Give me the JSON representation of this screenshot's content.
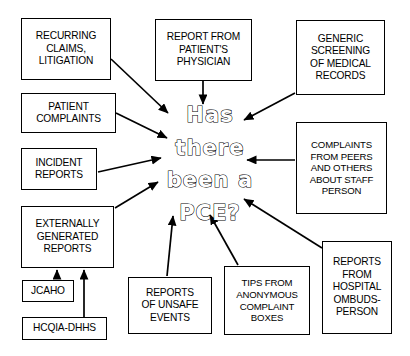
{
  "diagram": {
    "title": "Has there been a PCE?",
    "type": "convergent-flow-diagram",
    "background_color": "#ffffff",
    "line_color": "#000000",
    "center": {
      "lines": [
        "Has",
        "there",
        "been a",
        "PCE?"
      ],
      "full_text": "Has there been a PCE?",
      "style": "outlined"
    },
    "nodes": [
      {
        "id": "recurring-claims-litigation",
        "label": "RECURRING\nCLAIMS,\nLITIGATION",
        "x": 21,
        "y": 18,
        "w": 90,
        "h": 62
      },
      {
        "id": "report-from-patients-physician",
        "label": "REPORT FROM\nPATIENT'S\nPHYSICIAN",
        "x": 155,
        "y": 19,
        "w": 97,
        "h": 62
      },
      {
        "id": "generic-screening-of-medical-records",
        "label": "GENERIC\nSCREENING\nOF MEDICAL\nRECORDS",
        "x": 296,
        "y": 20,
        "w": 89,
        "h": 75
      },
      {
        "id": "patient-complaints",
        "label": "PATIENT\nCOMPLAINTS",
        "x": 21,
        "y": 93,
        "w": 95,
        "h": 40
      },
      {
        "id": "incident-reports",
        "label": "INCIDENT\nREPORTS",
        "x": 21,
        "y": 148,
        "w": 76,
        "h": 42
      },
      {
        "id": "complaints-from-peers",
        "label": "COMPLAINTS\nFROM PEERS\nAND OTHERS\nABOUT STAFF\nPERSON",
        "x": 296,
        "y": 122,
        "w": 91,
        "h": 92
      },
      {
        "id": "externally-generated-reports",
        "label": "EXTERNALLY\nGENERATED\nREPORTS",
        "x": 21,
        "y": 206,
        "w": 93,
        "h": 62
      },
      {
        "id": "jcaho",
        "label": "JCAHO",
        "x": 22,
        "y": 280,
        "w": 52,
        "h": 22
      },
      {
        "id": "hcqia-dhhs",
        "label": "HCQIA-DHHS",
        "x": 22,
        "y": 317,
        "w": 85,
        "h": 23
      },
      {
        "id": "reports-of-unsafe-events",
        "label": "REPORTS\nOF UNSAFE\nEVENTS",
        "x": 128,
        "y": 277,
        "w": 84,
        "h": 57
      },
      {
        "id": "tips-from-anonymous-complaint-boxes",
        "label": "TIPS FROM\nANONYMOUS\nCOMPLAINT\nBOXES",
        "x": 224,
        "y": 266,
        "w": 86,
        "h": 69
      },
      {
        "id": "reports-from-hospital-ombudsperson",
        "label": "REPORTS\nFROM\nHOSPITAL\nOMBUDS-\nPERSON",
        "x": 322,
        "y": 241,
        "w": 70,
        "h": 93
      }
    ],
    "arrows": [
      {
        "id": "arrow-recurring-claims-to-center",
        "from": "recurring-claims-litigation",
        "to": "center",
        "x1": 111,
        "y1": 59,
        "x2": 168,
        "y2": 113
      },
      {
        "id": "arrow-physician-to-center",
        "from": "report-from-patients-physician",
        "to": "center",
        "x1": 203,
        "y1": 81,
        "x2": 203,
        "y2": 104
      },
      {
        "id": "arrow-generic-screening-to-center",
        "from": "generic-screening-of-medical-records",
        "to": "center",
        "x1": 295,
        "y1": 93,
        "x2": 244,
        "y2": 120
      },
      {
        "id": "arrow-patient-complaints-to-center",
        "from": "patient-complaints",
        "to": "center",
        "x1": 116,
        "y1": 113,
        "x2": 167,
        "y2": 138
      },
      {
        "id": "arrow-incident-reports-to-center",
        "from": "incident-reports",
        "to": "center",
        "x1": 98,
        "y1": 172,
        "x2": 161,
        "y2": 158
      },
      {
        "id": "arrow-complaints-peers-to-center",
        "from": "complaints-from-peers",
        "to": "center",
        "x1": 295,
        "y1": 160,
        "x2": 247,
        "y2": 160
      },
      {
        "id": "arrow-externally-generated-to-center",
        "from": "externally-generated-reports",
        "to": "center",
        "x1": 115,
        "y1": 208,
        "x2": 158,
        "y2": 182
      },
      {
        "id": "arrow-jcaho-to-externally-generated",
        "from": "jcaho",
        "to": "externally-generated-reports",
        "x1": 57,
        "y1": 279,
        "x2": 57,
        "y2": 270
      },
      {
        "id": "arrow-hcqia-to-externally-generated",
        "from": "hcqia-dhhs",
        "to": "externally-generated-reports",
        "x1": 84,
        "y1": 317,
        "x2": 84,
        "y2": 270
      },
      {
        "id": "arrow-unsafe-events-to-center",
        "from": "reports-of-unsafe-events",
        "to": "center",
        "x1": 167,
        "y1": 276,
        "x2": 173,
        "y2": 216
      },
      {
        "id": "arrow-tips-to-center",
        "from": "tips-from-anonymous-complaint-boxes",
        "to": "center",
        "x1": 238,
        "y1": 265,
        "x2": 210,
        "y2": 215
      },
      {
        "id": "arrow-ombudsperson-to-center",
        "from": "reports-from-hospital-ombudsperson",
        "to": "center",
        "x1": 322,
        "y1": 248,
        "x2": 244,
        "y2": 199
      }
    ]
  }
}
